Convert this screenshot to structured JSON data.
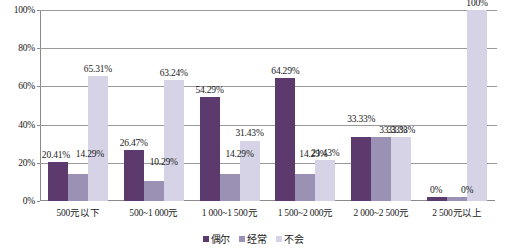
{
  "chart_data": {
    "type": "bar",
    "title": "",
    "subtitle": "",
    "xlabel": "",
    "ylabel": "",
    "ylim": [
      0,
      100
    ],
    "yticks": [
      "0%",
      "20%",
      "40%",
      "60%",
      "80%",
      "100%"
    ],
    "ytick_values": [
      0,
      20,
      40,
      60,
      80,
      100
    ],
    "grid": "horizontal",
    "legend_position": "bottom-center",
    "categories": [
      "500元以下",
      "500~1 000元",
      "1 000~1 500元",
      "1 500~2 000元",
      "2 000~2 500元",
      "2 500元以上"
    ],
    "series": [
      {
        "name": "偶尔",
        "color": "#5c3a6e",
        "values": [
          20.41,
          26.47,
          54.29,
          64.29,
          33.33,
          0
        ],
        "labels": [
          "20.41%",
          "26.47%",
          "54.29%",
          "64.29%",
          "33.33%",
          "0%"
        ]
      },
      {
        "name": "经常",
        "color": "#9b91b5",
        "values": [
          14.29,
          10.29,
          14.29,
          14.29,
          33.33,
          0
        ],
        "labels": [
          "14.29%",
          "10.29%",
          "14.29%",
          "14.29%",
          "33.33%",
          "0%"
        ]
      },
      {
        "name": "不会",
        "color": "#d5d3e5",
        "values": [
          65.31,
          63.24,
          31.43,
          21.43,
          33.33,
          100
        ],
        "labels": [
          "65.31%",
          "63.24%",
          "31.43%",
          "21.43%",
          "33.33%",
          "100%"
        ]
      }
    ]
  }
}
